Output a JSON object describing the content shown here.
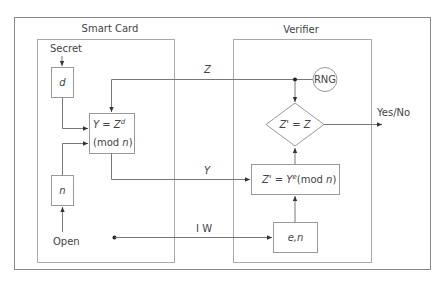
{
  "diagram": {
    "panels": {
      "smart_card": {
        "title": "Smart Card"
      },
      "verifier": {
        "title": "Verifier"
      }
    },
    "inputs": {
      "secret": "Secret",
      "open": "Open"
    },
    "nodes": {
      "d_box": "d",
      "n_box": "n",
      "compute_y_line1_prefix": "Y = Z",
      "compute_y_line1_sup": "d",
      "compute_y_line2_prefix": "(mod ",
      "compute_y_line2_var": "n",
      "compute_y_line2_suffix": ")",
      "rng": "RNG",
      "compare": "Z' = Z",
      "compute_z_prefix": "Z' = Y",
      "compute_z_sup": "e",
      "compute_z_mod": "(mod ",
      "compute_z_var": "n",
      "compute_z_suffix": ")",
      "en_box": "e,n"
    },
    "edges": {
      "z_label": "Z",
      "y_label": "Y",
      "iw_label": "I W",
      "output_label": "Yes/No"
    }
  }
}
